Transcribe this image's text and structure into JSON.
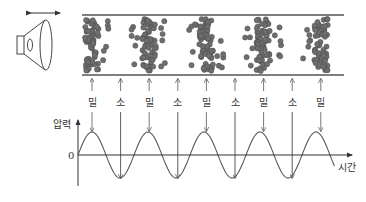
{
  "diagram": {
    "title": "",
    "labels": {
      "compression": "밀",
      "rarefaction": "소",
      "y_axis": "압력",
      "x_axis": "시간",
      "zero": "0"
    },
    "label_sequence": [
      "밀",
      "소",
      "밀",
      "소",
      "밀",
      "소",
      "밀",
      "소",
      "밀"
    ],
    "compression_count": 5,
    "rarefaction_count": 4,
    "wave": {
      "type": "sine",
      "periods_shown": 4.5,
      "starts_at": "zero, rising",
      "peaks_at": "compression",
      "troughs_at": "rarefaction"
    },
    "colors": {
      "particle_fill": "#6e6e6e",
      "particle_stroke": "#4a4a4a",
      "line": "#333333",
      "tube_line": "#555555"
    },
    "icons": [
      "speaker-icon",
      "double-arrow-icon"
    ]
  }
}
